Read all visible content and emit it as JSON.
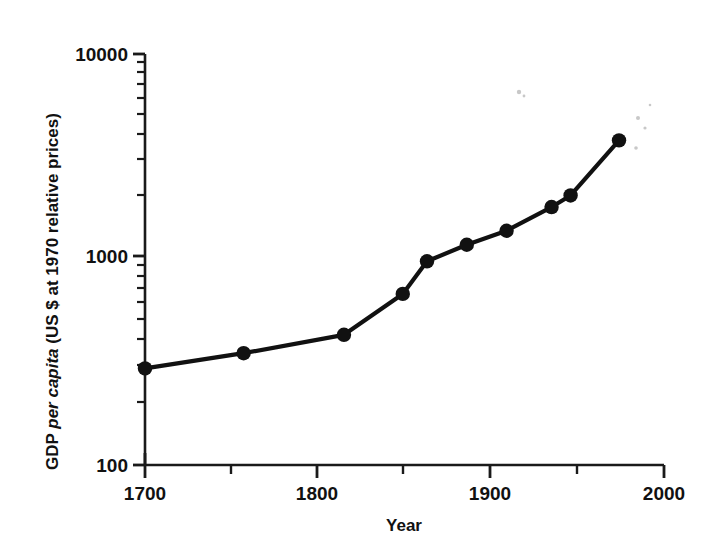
{
  "chart_data": {
    "type": "line",
    "title": "",
    "subtitle": "",
    "xlabel": "Year",
    "ylabel": "GDP per capita (US $ at 1970 relative prices)",
    "ylabel_parts": {
      "prefix": "GDP ",
      "italic": "per capita",
      "suffix": " (US $ at 1970 relative prices)"
    },
    "xlim": [
      1700,
      2000
    ],
    "ylim": [
      100,
      10000
    ],
    "yscale": "log",
    "xscale": "linear",
    "grid": false,
    "legend": null,
    "x_major_ticks": [
      1700,
      1800,
      1900,
      2000
    ],
    "x_major_tick_labels": [
      "1700",
      "1800",
      "1900",
      "2000"
    ],
    "x_minor_ticks": [
      1750,
      1850,
      1950
    ],
    "y_major_ticks": [
      100,
      1000,
      10000
    ],
    "y_major_tick_labels": [
      "100",
      "1000",
      "10000"
    ],
    "y_minor_ticks": [
      200,
      300,
      400,
      500,
      600,
      700,
      800,
      900,
      2000,
      3000,
      4000,
      5000,
      6000,
      7000,
      8000,
      9000
    ],
    "x": [
      1700,
      1757,
      1815,
      1849,
      1863,
      1886,
      1909,
      1935,
      1946,
      1974
    ],
    "y": [
      295,
      350,
      430,
      680,
      980,
      1180,
      1380,
      1800,
      2050,
      3800
    ],
    "series": [
      {
        "name": "GDP per capita",
        "points": [
          {
            "x": 1700,
            "y": 295
          },
          {
            "x": 1757,
            "y": 350
          },
          {
            "x": 1815,
            "y": 430
          },
          {
            "x": 1849,
            "y": 680
          },
          {
            "x": 1863,
            "y": 980
          },
          {
            "x": 1886,
            "y": 1180
          },
          {
            "x": 1909,
            "y": 1380
          },
          {
            "x": 1935,
            "y": 1800
          },
          {
            "x": 1946,
            "y": 2050
          },
          {
            "x": 1974,
            "y": 3800
          }
        ],
        "marker": "filled-circle",
        "color": "#111111"
      }
    ]
  },
  "axes": {
    "y_labels": [
      "10000",
      "1000",
      "100"
    ],
    "x_labels": [
      "1700",
      "1800",
      "1900",
      "2000"
    ],
    "x_title": "Year"
  },
  "colors": {
    "ink": "#111111",
    "background": "#ffffff"
  }
}
